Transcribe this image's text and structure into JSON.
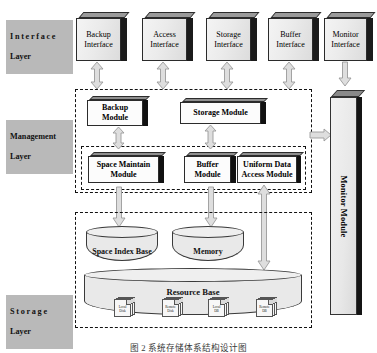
{
  "figure": {
    "caption": "图 2   系统存储体系结构设计图",
    "background": "#ffffff"
  },
  "layers": {
    "interface": {
      "line1": "Interface",
      "line2": "Layer",
      "plate_color": "#b9b9b9"
    },
    "management": {
      "line1": "Management",
      "line2": "Layer",
      "plate_color": "#b9b9b9"
    },
    "storage": {
      "line1": "Storage",
      "line2": "Layer",
      "plate_color": "#b9b9b9"
    }
  },
  "interface_layer": {
    "boxes": [
      {
        "line1": "Backup",
        "line2": "Interface"
      },
      {
        "line1": "Access",
        "line2": "Interface"
      },
      {
        "line1": "Storage",
        "line2": "Interface"
      },
      {
        "line1": "Buffer",
        "line2": "Interface"
      },
      {
        "line1": "Monitor",
        "line2": "Interface"
      }
    ]
  },
  "management_layer": {
    "upper_modules": [
      {
        "line1": "Backup",
        "line2": "Module"
      },
      {
        "line1": "Storage Module",
        "line2": ""
      }
    ],
    "lower_modules": [
      {
        "line1": "Space Maintain",
        "line2": "Module"
      },
      {
        "line1": "Buffer",
        "line2": "Module"
      },
      {
        "line1": "Uniform Data",
        "line2": "Access Module"
      }
    ]
  },
  "monitor": {
    "label": "Monitor Module"
  },
  "storage_layer": {
    "cylinders": [
      {
        "label": "Space Index Base"
      },
      {
        "label": "Memory"
      }
    ],
    "resource_base": {
      "label": "Resource Base",
      "documents": [
        {
          "line1": "Local",
          "line2": "Disk"
        },
        {
          "line1": "Remote",
          "line2": "Disk"
        },
        {
          "line1": "Local",
          "line2": "DB"
        },
        {
          "line1": "Remote",
          "line2": "DB"
        }
      ]
    }
  },
  "connectors": {
    "interface_to_management": {
      "kind": "double-arrow-vertical",
      "count": 4
    },
    "monitor_interface_to_monitor_module": {
      "kind": "down-arrow-vertical"
    },
    "management_to_monitor": {
      "kind": "right-arrow-horizontal"
    },
    "upper_to_lower_modules": {
      "kind": "double-arrow-vertical",
      "count": 2
    },
    "management_to_storage": {
      "kind": "down-arrow-vertical",
      "count": 2
    },
    "uniform_access_to_resource_base": {
      "kind": "double-arrow-vertical"
    },
    "arrow_fill": "#dedede",
    "arrow_stroke": "#9a9a9a"
  }
}
